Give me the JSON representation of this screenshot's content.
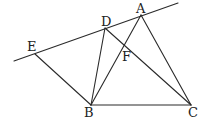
{
  "diagram": {
    "type": "geometry",
    "points": {
      "A": {
        "label": "A"
      },
      "B": {
        "label": "B"
      },
      "C": {
        "label": "C"
      },
      "D": {
        "label": "D"
      },
      "E": {
        "label": "E"
      },
      "F": {
        "label": "F"
      }
    },
    "segments": [
      [
        "E",
        "B"
      ],
      [
        "B",
        "D"
      ],
      [
        "B",
        "A"
      ],
      [
        "B",
        "C"
      ],
      [
        "A",
        "C"
      ],
      [
        "D",
        "C"
      ]
    ],
    "lines": [
      [
        "E",
        "A"
      ]
    ],
    "intersections": [
      {
        "point": "F",
        "of": [
          [
            "B",
            "A"
          ],
          [
            "D",
            "C"
          ]
        ]
      }
    ]
  }
}
